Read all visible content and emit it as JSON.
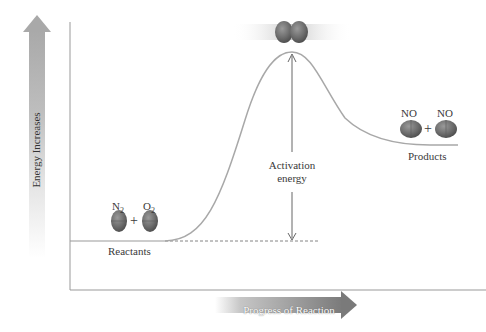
{
  "diagram": {
    "type": "energy_profile",
    "y_axis_label": "Energy Increases",
    "x_axis_label": "Progress of Reaction",
    "reactants": {
      "label": "Reactants",
      "molecules": [
        {
          "formula": "N",
          "subscript": "2"
        },
        {
          "formula": "O",
          "subscript": "2"
        }
      ],
      "plus": "+"
    },
    "products": {
      "label": "Products",
      "molecules": [
        {
          "formula": "NO",
          "subscript": ""
        },
        {
          "formula": "NO",
          "subscript": ""
        }
      ],
      "plus": "+"
    },
    "activation_energy": {
      "line1": "Activation",
      "line2": "energy"
    },
    "transition_state": "colliding-molecules"
  },
  "colors": {
    "curve": "#a8a8a8",
    "axis": "#888888",
    "molecule": "#6a6a6a",
    "arrow_fill": "#8c8c8c",
    "text": "#333333"
  }
}
